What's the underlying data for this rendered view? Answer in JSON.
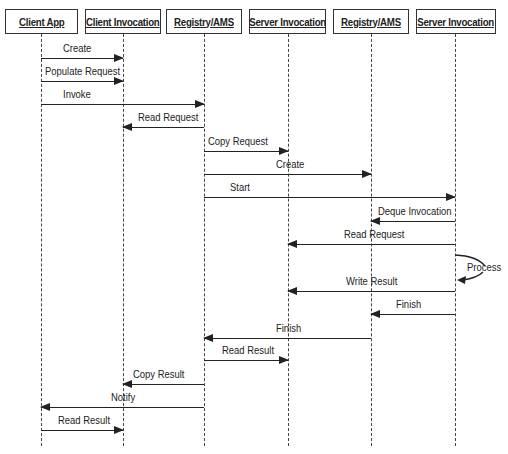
{
  "diagram": {
    "type": "sequence-diagram",
    "actors": [
      {
        "label": "Client App",
        "x": 41
      },
      {
        "label": "Client Invocation",
        "x": 123
      },
      {
        "label": "Registry/AMS",
        "x": 204
      },
      {
        "label": "Server Invocation",
        "x": 288
      },
      {
        "label": "Registry/AMS",
        "x": 371
      },
      {
        "label": "Server Invocation",
        "x": 455
      }
    ],
    "messages": [
      {
        "label": "Create",
        "from": 0,
        "to": 1,
        "y": 58
      },
      {
        "label": "Populate Request",
        "from": 0,
        "to": 1,
        "y": 81
      },
      {
        "label": "Invoke",
        "from": 0,
        "to": 2,
        "y": 104
      },
      {
        "label": "Read Request",
        "from": 2,
        "to": 1,
        "y": 127
      },
      {
        "label": "Copy Request",
        "from": 2,
        "to": 3,
        "y": 151
      },
      {
        "label": "Create",
        "from": 2,
        "to": 4,
        "y": 174
      },
      {
        "label": "Start",
        "from": 2,
        "to": 5,
        "y": 197
      },
      {
        "label": "Deque Invocation",
        "from": 5,
        "to": 4,
        "y": 221
      },
      {
        "label": "Read Request",
        "from": 5,
        "to": 3,
        "y": 244
      },
      {
        "label": "Process",
        "from": 5,
        "to": 5,
        "y": 256,
        "self": true
      },
      {
        "label": "Write Result",
        "from": 5,
        "to": 3,
        "y": 291
      },
      {
        "label": "Finish",
        "from": 5,
        "to": 4,
        "y": 314
      },
      {
        "label": "Finish",
        "from": 4,
        "to": 2,
        "y": 338
      },
      {
        "label": "Read Result",
        "from": 2,
        "to": 3,
        "y": 360
      },
      {
        "label": "Copy Result",
        "from": 2,
        "to": 1,
        "y": 384
      },
      {
        "label": "Notify",
        "from": 2,
        "to": 0,
        "y": 407
      },
      {
        "label": "Read Result",
        "from": 0,
        "to": 1,
        "y": 430
      }
    ]
  }
}
